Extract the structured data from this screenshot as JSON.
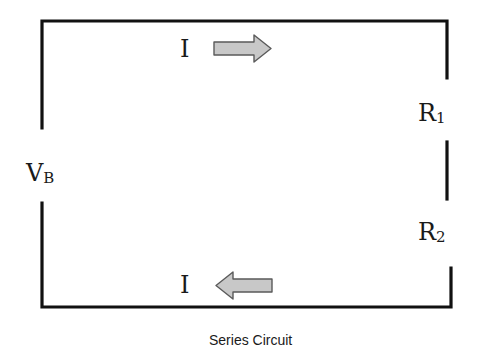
{
  "diagram": {
    "title": "Series Circuit",
    "colors": {
      "wire": "#111111",
      "arrow_fill": "#c8c8c8",
      "arrow_stroke": "#5a5a5a",
      "text": "#1a1a1a",
      "background": "#ffffff"
    },
    "labels": {
      "current_top": "I",
      "current_bottom": "I",
      "battery": {
        "main": "V",
        "sub": "B"
      },
      "resistor1": {
        "main": "R",
        "sub": "1"
      },
      "resistor2": {
        "main": "R",
        "sub": "2"
      }
    },
    "arrows": [
      {
        "name": "current-arrow-top",
        "direction": "right"
      },
      {
        "name": "current-arrow-bottom",
        "direction": "left"
      }
    ],
    "caption": "Series Circuit"
  }
}
